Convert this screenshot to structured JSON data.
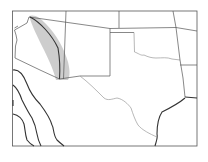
{
  "map": {
    "region": "Southwestern United States",
    "frame": {
      "x": 12.5,
      "y": 11,
      "width": 184.5,
      "height": 135
    },
    "colors": {
      "background": "#ffffff",
      "border": "#555555",
      "shaded_region": "#c8c8c8",
      "contours": "#333333"
    },
    "shaded_region_label": "shaded-band",
    "features": [
      "state-borders",
      "shaded-band",
      "contour-lines"
    ]
  }
}
